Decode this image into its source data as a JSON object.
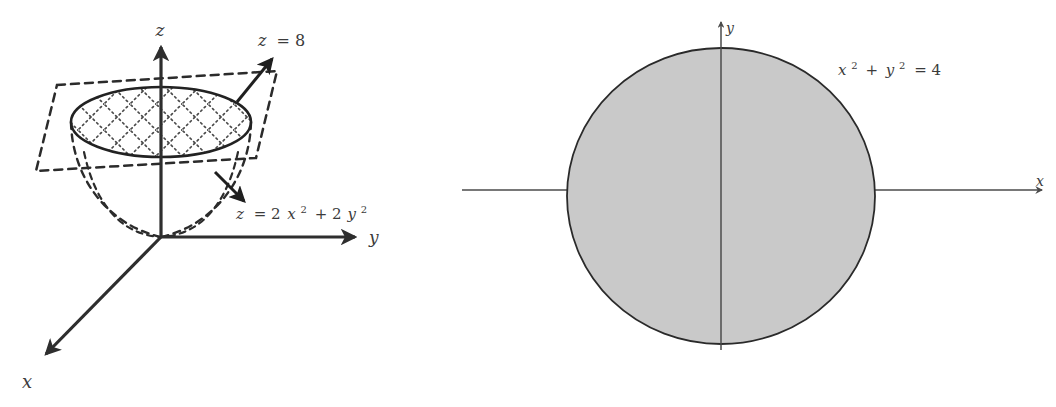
{
  "figure": {
    "panels": [
      {
        "id": "left-3d-panel",
        "name": "three-dimensional-paraboloid-diagram",
        "axes": [
          {
            "id": "x-axis",
            "label": "x",
            "direction": "down-left"
          },
          {
            "id": "y-axis",
            "label": "y",
            "direction": "right"
          },
          {
            "id": "z-axis",
            "label": "z",
            "direction": "up"
          }
        ],
        "annotations": [
          {
            "id": "plane-label",
            "text": "z = 8",
            "pointer": "arrow-up-right"
          },
          {
            "id": "paraboloid-label",
            "text": "z = 2x² + 2y²",
            "pointer": "arrow-down-right"
          }
        ],
        "parts": {
          "cutting_plane": "dashed parallelogram at z = 8",
          "paraboloid": "dashed bowl opening upward from origin",
          "cross_section": "solid ellipse with cross-hatched interior"
        }
      },
      {
        "id": "right-2d-panel",
        "name": "circular-projection-diagram",
        "axes": [
          {
            "id": "x-axis",
            "label": "x",
            "direction": "right"
          },
          {
            "id": "y-axis",
            "label": "y",
            "direction": "up"
          }
        ],
        "annotations": [
          {
            "id": "circle-label",
            "text": "x² + y² = 4"
          }
        ],
        "parts": {
          "region": "shaded disk of radius 2 centered at the origin"
        }
      }
    ],
    "label_parts": {
      "plane_z": "z",
      "plane_eq": "= 8",
      "parab_z": "z",
      "parab_eq_a": "= 2",
      "parab_x": "x",
      "parab_sup2a": "2",
      "parab_plus": "+ 2",
      "parab_y": "y",
      "parab_sup2b": "2",
      "circ_x": "x",
      "circ_sup2a": "2",
      "circ_plus": "+",
      "circ_y": "y",
      "circ_sup2b": "2",
      "circ_eq": "= 4",
      "axis_x_left": "x",
      "axis_y_left": "y",
      "axis_z_left": "z",
      "axis_x_right": "x",
      "axis_y_right": "y"
    },
    "colors": {
      "ink": "#2e2e2e",
      "label_ink": "#3b3b3b",
      "shade_fill": "#c9c9c9",
      "outline": "#222222",
      "background": "#ffffff"
    }
  }
}
